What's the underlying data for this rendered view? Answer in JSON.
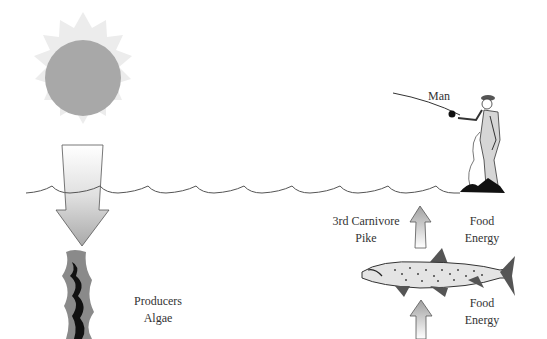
{
  "diagram": {
    "type": "food-chain",
    "colors": {
      "sun_core": "#a8a8a8",
      "sun_rays": "#ececec",
      "arrow_fill": "#b8b8b8",
      "water_line": "#555555",
      "fish_body": "#e4e4e4",
      "fish_fins": "#555555"
    },
    "nodes": [
      {
        "id": "sun",
        "icon": "sun-icon"
      },
      {
        "id": "man",
        "label": "Man",
        "icon": "fisherman-icon"
      },
      {
        "id": "pike",
        "label_line1": "3rd Carnivore",
        "label_line2": "Pike",
        "icon": "fish-icon"
      },
      {
        "id": "algae",
        "label_line1": "Producers",
        "label_line2": "Algae",
        "icon": "algae-icon"
      }
    ],
    "arrows": [
      {
        "from": "sun",
        "to": "algae",
        "icon": "sunlight-arrow-icon"
      },
      {
        "from": "pike",
        "to": "man",
        "label_line1": "Food",
        "label_line2": "Energy",
        "icon": "arrow-up-icon"
      },
      {
        "from": "below",
        "to": "pike",
        "label_line1": "Food",
        "label_line2": "Energy",
        "icon": "arrow-up-icon"
      }
    ]
  }
}
